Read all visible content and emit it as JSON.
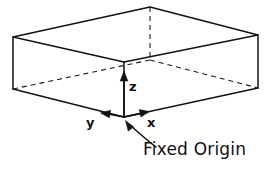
{
  "figure": {
    "title": "Fixed Origin",
    "background_color": "#ffffff",
    "ink_color": "#111111",
    "width": 270,
    "height": 175
  },
  "caption": {
    "text": "Fixed Origin",
    "leader": "curved-arrow-to-origin"
  },
  "axes": {
    "origin": {
      "x": 124,
      "y": 117
    },
    "items": [
      {
        "name": "z",
        "label": "z",
        "direction": "up",
        "tip_x": 124,
        "tip_y": 72
      },
      {
        "name": "y",
        "label": "y",
        "direction": "left",
        "tip_x": 101,
        "tip_y": 113
      },
      {
        "name": "x",
        "label": "x",
        "direction": "right",
        "tip_x": 149,
        "tip_y": 112
      }
    ]
  },
  "solid": {
    "shape": "rectangular-slab",
    "top_face": [
      {
        "x": 13,
        "y": 37
      },
      {
        "x": 150,
        "y": 7
      },
      {
        "x": 258,
        "y": 35
      },
      {
        "x": 124,
        "y": 62
      }
    ],
    "bottom_face": [
      {
        "x": 13,
        "y": 89
      },
      {
        "x": 150,
        "y": 60
      },
      {
        "x": 258,
        "y": 88
      },
      {
        "x": 124,
        "y": 117
      }
    ],
    "hidden_edges": [
      "back-vertical",
      "back-left-bottom",
      "back-right-bottom"
    ],
    "visible_edges": [
      "top-face",
      "front-left-bottom",
      "front-right-bottom",
      "left-vertical",
      "right-vertical",
      "front-vertical"
    ]
  }
}
